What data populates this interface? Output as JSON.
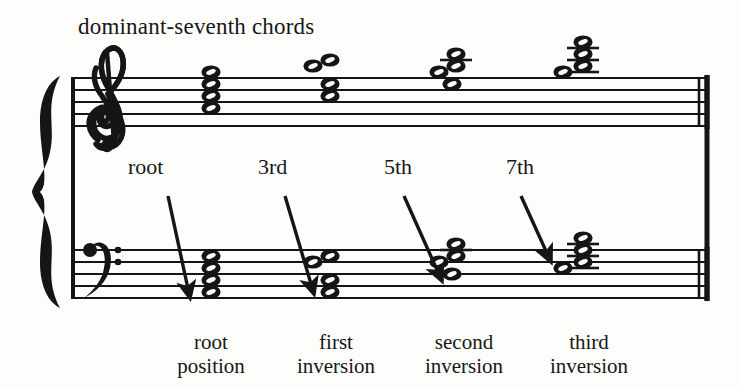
{
  "figure": {
    "title": "dominant-seventh chords",
    "ink_color": "#151515",
    "paper_color": "#fdfdfc"
  },
  "staff": {
    "treble_clef": "treble-clef",
    "bass_clef": "bass-clef",
    "brace": "grand-staff-brace",
    "final_barline": "double-barline",
    "treble_top_line_y": 78,
    "bass_top_line_y": 250,
    "line_spacing": 12,
    "staff_left_x": 72,
    "staff_right_x": 709
  },
  "interval_labels": [
    {
      "text": "root",
      "x": 128,
      "y": 172,
      "arrow_from_x": 168,
      "arrow_from_y": 196,
      "arrow_to_x": 190,
      "arrow_to_y": 298
    },
    {
      "text": "3rd",
      "x": 258,
      "y": 172,
      "arrow_from_x": 285,
      "arrow_from_y": 196,
      "arrow_to_x": 314,
      "arrow_to_y": 294
    },
    {
      "text": "5th",
      "x": 384,
      "y": 172,
      "arrow_from_x": 404,
      "arrow_from_y": 196,
      "arrow_to_x": 442,
      "arrow_to_y": 281
    },
    {
      "text": "7th",
      "x": 506,
      "y": 172,
      "arrow_from_x": 521,
      "arrow_from_y": 196,
      "arrow_to_x": 551,
      "arrow_to_y": 262
    }
  ],
  "captions": [
    {
      "line1": "root",
      "line2": "position",
      "center_x": 211
    },
    {
      "line1": "first",
      "line2": "inversion",
      "center_x": 336
    },
    {
      "line1": "second",
      "line2": "inversion",
      "center_x": 464
    },
    {
      "line1": "third",
      "line2": "inversion",
      "center_x": 589
    }
  ],
  "chords": [
    {
      "name": "root-position",
      "label": "root position",
      "treble": {
        "x": 211,
        "notes": [
          {
            "y": 72,
            "offset": 0,
            "ledger": false
          },
          {
            "y": 84,
            "offset": 0,
            "ledger": false
          },
          {
            "y": 96,
            "offset": 0,
            "ledger": false
          },
          {
            "y": 108,
            "offset": 0,
            "ledger": false
          }
        ],
        "ledger_lines": []
      },
      "bass": {
        "x": 211,
        "notes": [
          {
            "y": 256,
            "offset": 0
          },
          {
            "y": 268,
            "offset": 0
          },
          {
            "y": 280,
            "offset": 0
          },
          {
            "y": 292,
            "offset": 0
          }
        ],
        "ledger_lines": []
      }
    },
    {
      "name": "first-inversion",
      "label": "first inversion",
      "treble": {
        "x": 330,
        "notes": [
          {
            "y": 66,
            "offset": -17
          },
          {
            "y": 60,
            "offset": 0
          },
          {
            "y": 84,
            "offset": 0
          },
          {
            "y": 96,
            "offset": 0
          }
        ],
        "ledger_lines": []
      },
      "bass": {
        "x": 330,
        "notes": [
          {
            "y": 262,
            "offset": -17
          },
          {
            "y": 256,
            "offset": 0
          },
          {
            "y": 280,
            "offset": 0
          },
          {
            "y": 292,
            "offset": 0
          }
        ],
        "ledger_lines": []
      }
    },
    {
      "name": "second-inversion",
      "label": "second inversion",
      "treble": {
        "x": 456,
        "notes": [
          {
            "y": 72,
            "offset": -17
          },
          {
            "y": 54,
            "offset": 0
          },
          {
            "y": 66,
            "offset": 0
          },
          {
            "y": 84,
            "offset": -4
          }
        ],
        "ledger_lines": [
          60
        ]
      },
      "bass": {
        "x": 456,
        "notes": [
          {
            "y": 262,
            "offset": -17
          },
          {
            "y": 244,
            "offset": 0
          },
          {
            "y": 256,
            "offset": 0
          },
          {
            "y": 274,
            "offset": -4
          }
        ],
        "ledger_lines": [
          250
        ]
      }
    },
    {
      "name": "third-inversion",
      "label": "third inversion",
      "treble": {
        "x": 583,
        "notes": [
          {
            "y": 72,
            "offset": -20
          },
          {
            "y": 42,
            "offset": 0
          },
          {
            "y": 54,
            "offset": 0
          },
          {
            "y": 66,
            "offset": 0
          }
        ],
        "ledger_lines": [
          48,
          60,
          72
        ]
      },
      "bass": {
        "x": 583,
        "notes": [
          {
            "y": 268,
            "offset": -20
          },
          {
            "y": 238,
            "offset": 0
          },
          {
            "y": 250,
            "offset": 0
          },
          {
            "y": 262,
            "offset": 0
          }
        ],
        "ledger_lines": [
          244,
          256,
          268
        ]
      }
    }
  ]
}
